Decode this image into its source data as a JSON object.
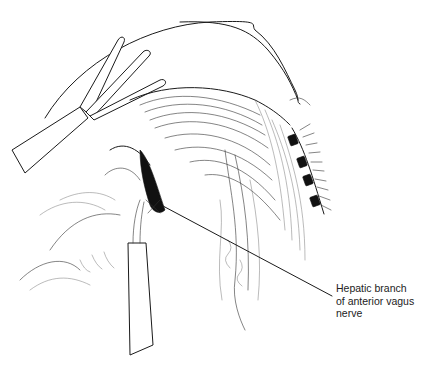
{
  "figure": {
    "type": "surgical line illustration",
    "callout": {
      "lines": [
        "Hepatic branch",
        "of anterior vagus",
        "nerve"
      ]
    },
    "colors": {
      "ink": "#1a1a1a",
      "background": "#ffffff"
    }
  }
}
